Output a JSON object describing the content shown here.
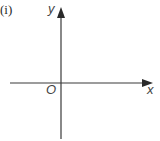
{
  "part_label": "(i)",
  "axes": {
    "x_label": "x",
    "y_label": "y",
    "origin_label": "O"
  },
  "colors": {
    "axis": "#3a3a3a",
    "background": "#ffffff"
  }
}
